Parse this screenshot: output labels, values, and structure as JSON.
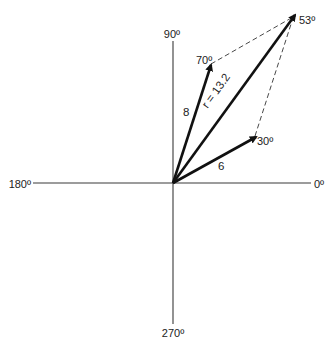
{
  "diagram": {
    "type": "vector-addition-polar",
    "origin": {
      "x": 173,
      "y": 183
    },
    "axes": {
      "x_pos_label": "0º",
      "y_pos_label": "90º",
      "x_neg_label": "180º",
      "y_neg_label": "270º"
    },
    "vectors": [
      {
        "id": "vector-a",
        "magnitude_label": "8",
        "angle_label": "70º",
        "magnitude": 8,
        "angle_deg": 70
      },
      {
        "id": "vector-b",
        "magnitude_label": "6",
        "angle_label": "30º",
        "magnitude": 6,
        "angle_deg": 30
      },
      {
        "id": "resultant",
        "magnitude_label": "r = 13.2",
        "angle_label": "53º",
        "magnitude": 13.2,
        "angle_deg": 53
      }
    ],
    "colors": {
      "vector": "#111111",
      "axis": "#3a3a3a",
      "text": "#222222"
    }
  }
}
